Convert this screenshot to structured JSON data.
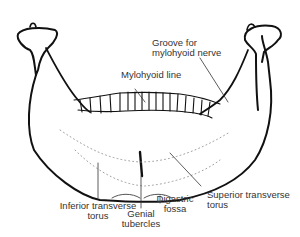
{
  "figure": {
    "colors": {
      "ink": "#111111",
      "label": "#333333",
      "stipple": "#888888"
    },
    "labels": {
      "groove": [
        "Groove for",
        "mylohyoid nerve"
      ],
      "mylohyoid_line": "Mylohyoid line",
      "inferior_torus": [
        "Inferior transverse",
        "torus"
      ],
      "genial": [
        "Genial",
        "tubercles"
      ],
      "digastric": [
        "Digastric",
        "fossa"
      ],
      "superior_torus": [
        "Superior transverse",
        "torus"
      ]
    }
  }
}
